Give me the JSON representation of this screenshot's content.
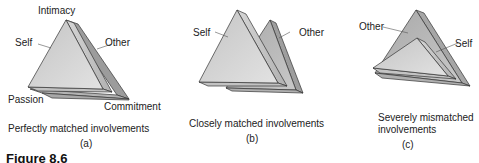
{
  "figure": {
    "caption_fragment": "Figure 8.6"
  },
  "panels": [
    {
      "id": "a",
      "sublabel": "(a)",
      "caption": "Perfectly matched involvements",
      "labels": {
        "top": "Intimacy",
        "left_vertex": "Passion",
        "right_vertex": "Commitment",
        "self": "Self",
        "other": "Other"
      }
    },
    {
      "id": "b",
      "sublabel": "(b)",
      "caption": "Closely matched involvements",
      "labels": {
        "self": "Self",
        "other": "Other"
      }
    },
    {
      "id": "c",
      "sublabel": "(c)",
      "caption_line1": "Severely mismatched",
      "caption_line2": "involvements",
      "labels": {
        "self": "Self",
        "other": "Other"
      }
    }
  ],
  "colors": {
    "face_light": "#d8d8d8",
    "face_mid": "#b8b8b8",
    "face_dark": "#9a9a9a",
    "edge": "#333333"
  }
}
